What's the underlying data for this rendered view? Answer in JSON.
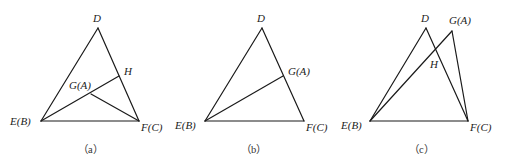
{
  "figure": {
    "stroke_color": "#1a1a1a",
    "panels": [
      {
        "id": "a",
        "caption": "（a）",
        "points": {
          "D": {
            "label": "D",
            "x": 98,
            "y": 28
          },
          "E": {
            "label": "E(B)",
            "x": 41,
            "y": 121
          },
          "F": {
            "label": "F(C)",
            "x": 139,
            "y": 121
          },
          "G": {
            "label": "G(A)",
            "x": 91,
            "y": 94
          },
          "H": {
            "label": "H",
            "x": 119,
            "y": 76
          }
        },
        "segments": [
          [
            "D",
            "E"
          ],
          [
            "D",
            "F"
          ],
          [
            "E",
            "F"
          ],
          [
            "E",
            "H"
          ],
          [
            "G",
            "F"
          ]
        ]
      },
      {
        "id": "b",
        "caption": "（b）",
        "points": {
          "D": {
            "label": "D",
            "x": 262,
            "y": 28
          },
          "E": {
            "label": "E(B)",
            "x": 205,
            "y": 121
          },
          "F": {
            "label": "F(C)",
            "x": 304,
            "y": 121
          },
          "G": {
            "label": "G(A)",
            "x": 283,
            "y": 76
          }
        },
        "segments": [
          [
            "D",
            "E"
          ],
          [
            "D",
            "F"
          ],
          [
            "E",
            "F"
          ],
          [
            "E",
            "G"
          ]
        ]
      },
      {
        "id": "c",
        "caption": "（c）",
        "points": {
          "D": {
            "label": "D",
            "x": 426,
            "y": 28
          },
          "G": {
            "label": "G(A)",
            "x": 452,
            "y": 31
          },
          "E": {
            "label": "E(B)",
            "x": 370,
            "y": 121
          },
          "F": {
            "label": "F(C)",
            "x": 468,
            "y": 121
          },
          "H": {
            "label": "H",
            "x": 436,
            "y": 47
          }
        },
        "segments": [
          [
            "D",
            "E"
          ],
          [
            "D",
            "F"
          ],
          [
            "E",
            "F"
          ],
          [
            "E",
            "G"
          ],
          [
            "G",
            "F"
          ]
        ]
      }
    ]
  }
}
